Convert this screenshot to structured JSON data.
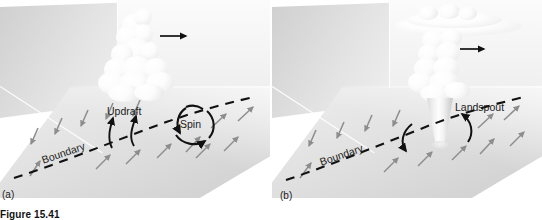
{
  "figure": {
    "caption": "Figure 15.41",
    "panels": [
      {
        "tag": "(a)",
        "labels": {
          "updraft": "Updraft",
          "spin": "Spin",
          "boundary": "Boundary"
        },
        "icons": {
          "storm_motion": "right-arrow-icon",
          "updraft_arrow": "curved-up-arrow-icon",
          "spin_loop": "circular-rotation-arrow-icon",
          "boundary_line": "dashed-line-icon",
          "surface_wind": "gray-arrow-icon"
        },
        "counts": {
          "surface_wind_arrows_left": 5,
          "surface_wind_arrows_right": 7,
          "updraft_arrows": 2
        }
      },
      {
        "tag": "(b)",
        "labels": {
          "landspout": "Landspout",
          "boundary": "Boundary"
        },
        "icons": {
          "storm_motion": "right-arrow-icon",
          "funnel": "tornado-funnel-icon",
          "rotation_arrow": "curved-rotation-arrow-icon",
          "boundary_line": "dashed-line-icon",
          "surface_wind": "gray-arrow-icon"
        },
        "counts": {
          "surface_wind_arrows_left": 4,
          "surface_wind_arrows_right": 6,
          "rotation_arrows": 2
        }
      }
    ],
    "colors": {
      "background": "#ffffff",
      "back_wall": "#dcdcdc",
      "ground_plane": "#e2e2e2",
      "cloud": "#fbfbfb",
      "surface_wind_arrow": "#8d8d8d",
      "boundary_and_annotation": "#111111",
      "label_text": "#1b1b1b"
    }
  }
}
